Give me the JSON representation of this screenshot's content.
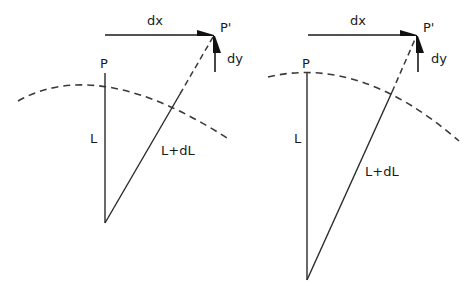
{
  "diagram": {
    "stroke_color": "#2a2a2a",
    "dash_color": "#3a3a3a",
    "panels": [
      {
        "id": "left",
        "labels": {
          "dx": "dx",
          "dy": "dy",
          "p": "P",
          "p_prime": "P'",
          "l": "L",
          "l_plus_dl": "L+dL"
        }
      },
      {
        "id": "right",
        "labels": {
          "dx": "dx",
          "dy": "dy",
          "p": "P",
          "p_prime": "P'",
          "l": "L",
          "l_plus_dl": "L+dL"
        }
      }
    ]
  }
}
